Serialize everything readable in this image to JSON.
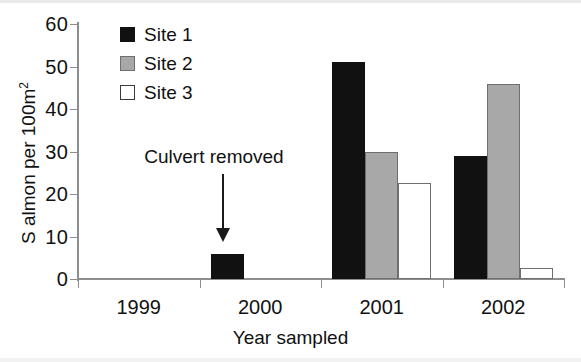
{
  "chart_data": {
    "type": "bar",
    "title": "",
    "xlabel": "Year sampled",
    "ylabel": "S almon per 100m2",
    "ylabel_base": "S almon per 100m",
    "ylabel_superscript": "2",
    "categories": [
      "1999",
      "2000",
      "2001",
      "2002"
    ],
    "series": [
      {
        "name": "Site 1",
        "color": "#111111",
        "values": [
          0,
          6,
          51,
          29
        ]
      },
      {
        "name": "Site 2",
        "color": "#a8a8a8",
        "values": [
          0,
          0,
          30,
          45.8
        ]
      },
      {
        "name": "Site 3",
        "color": "#ffffff",
        "values": [
          0,
          0,
          22.5,
          2.7
        ]
      }
    ],
    "ylim": [
      0,
      60
    ],
    "yticks": [
      0,
      10,
      20,
      30,
      40,
      50,
      60
    ],
    "ytick_labels": [
      "0",
      "10",
      "20",
      "30",
      "40",
      "50",
      "60"
    ],
    "grid": false,
    "legend_position": "top-left",
    "annotations": [
      {
        "text": "Culvert removed",
        "points_to_category": "2000",
        "arrow": "down"
      }
    ]
  },
  "legend": {
    "items": [
      {
        "label": "Site 1",
        "swatch": "filled-black-square"
      },
      {
        "label": "Site 2",
        "swatch": "filled-gray-square"
      },
      {
        "label": "Site 3",
        "swatch": "open-white-square"
      }
    ]
  },
  "annotation": {
    "label": "Culvert removed",
    "arrow_icon": "down-arrow-icon"
  },
  "colors": {
    "site1": "#111111",
    "site2": "#a8a8a8",
    "site3": "#ffffff",
    "axis": "#8e8e8e",
    "text": "#111111"
  }
}
